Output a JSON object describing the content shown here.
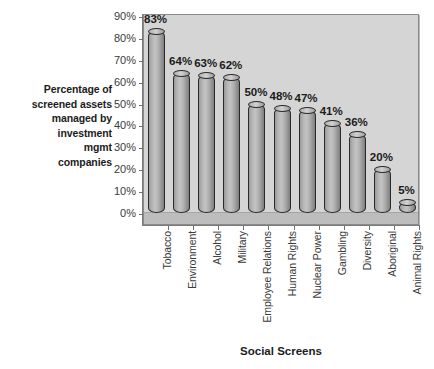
{
  "chart_data": {
    "type": "bar",
    "title": "",
    "subtitle": "",
    "xlabel": "Social Screens",
    "ylabel": "Percentage of screened assets managed by investment mgmt companies",
    "ylabel_lines": [
      "Percentage of",
      "screened assets",
      "managed by",
      "investment",
      "mgmt",
      "companies"
    ],
    "categories": [
      "Tobacco",
      "Environment",
      "Alcohol",
      "Military",
      "Employee Relations",
      "Human Rights",
      "Nuclear Power",
      "Gambling",
      "Diversity",
      "Aboriginal",
      "Animal Rights"
    ],
    "values": [
      83,
      64,
      63,
      62,
      50,
      48,
      47,
      41,
      36,
      20,
      5
    ],
    "data_labels": [
      "83%",
      "64%",
      "63%",
      "62%",
      "50%",
      "48%",
      "47%",
      "41%",
      "36%",
      "20%",
      "5%"
    ],
    "ylim": [
      0,
      90
    ],
    "ytick_values": [
      0,
      10,
      20,
      30,
      40,
      50,
      60,
      70,
      80,
      90
    ],
    "ytick_labels": [
      "0%",
      "10%",
      "20%",
      "30%",
      "40%",
      "50%",
      "60%",
      "70%",
      "80%",
      "90%"
    ],
    "grid": false,
    "legend": null,
    "legend_position": "none",
    "series": [
      {
        "name": "Percentage of screened assets",
        "values": [
          83,
          64,
          63,
          62,
          50,
          48,
          47,
          41,
          36,
          20,
          5
        ]
      }
    ],
    "colors": {
      "plot_background": "#d5d5d5",
      "page_background": "#ffffff",
      "bar_fill": "#b4b4b4",
      "bar_outline": "#2a2a2a",
      "axis": "#7a7a7a",
      "text": "#2b2b2b"
    }
  }
}
